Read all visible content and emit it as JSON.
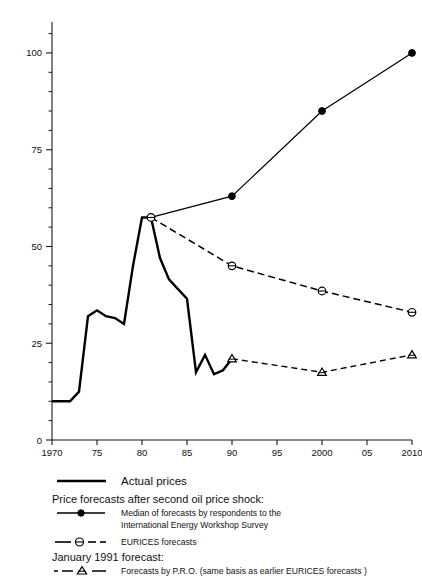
{
  "figure": {
    "y_axis_title": "CRUDE OIL PRICE* PER Bbl. 1990 $",
    "x_axis_title": "YEAR",
    "footnote": "*Average annual price for internationally traded crude oil"
  },
  "legend": {
    "actual_label": "Actual prices",
    "forecast_header": "Price forecasts after second oil price shock:",
    "iew_label_line1": "Median of forecasts by respondents to the",
    "iew_label_line2": "International Energy Workshop Survey",
    "eurices_label": "EURICES forecasts",
    "january_header": "January 1991 forecast:",
    "pro_label": "Forecasts by P.R.O. (same basis as earlier EURICES forecasts )"
  },
  "chart_data": {
    "type": "line",
    "title": "",
    "xlabel": "YEAR",
    "ylabel": "CRUDE OIL PRICE* PER Bbl. 1990 $",
    "xlim": [
      1970,
      2010
    ],
    "ylim": [
      0,
      108
    ],
    "grid": false,
    "legend_position": "below-plot",
    "xticks": [
      1970,
      1975,
      1980,
      1985,
      1990,
      1995,
      2000,
      2005,
      2010
    ],
    "xticklabels": [
      "1970",
      "75",
      "80",
      "85",
      "90",
      "95",
      "2000",
      "05",
      "2010"
    ],
    "yticks": [
      0,
      25,
      50,
      75,
      100
    ],
    "yticklabels": [
      "0",
      "25",
      "50",
      "75",
      "100"
    ],
    "yminorticks": [
      5,
      10,
      15,
      20,
      30,
      35,
      40,
      45,
      55,
      60,
      65,
      70,
      80,
      85,
      90,
      95,
      105
    ],
    "series": [
      {
        "name": "Actual prices",
        "style": "solid-thick",
        "marker": "none",
        "x": [
          1970,
          1971,
          1972,
          1973,
          1974,
          1975,
          1976,
          1977,
          1978,
          1979,
          1980,
          1981,
          1982,
          1983,
          1984,
          1985,
          1986,
          1987,
          1988,
          1989,
          1990
        ],
        "y": [
          10,
          10,
          10,
          12.5,
          32,
          33.5,
          32,
          31.5,
          30,
          45,
          57.5,
          57.5,
          47,
          41.5,
          39,
          36.5,
          17.5,
          22,
          17,
          18,
          21
        ]
      },
      {
        "name": "Median of forecasts by respondents to the International Energy Workshop Survey",
        "style": "solid-thin",
        "marker": "filled-circle",
        "x": [
          1981,
          1990,
          2000,
          2010
        ],
        "y": [
          57.5,
          63,
          85,
          100
        ]
      },
      {
        "name": "EURICES forecasts",
        "style": "dashed",
        "marker": "open-circle",
        "x": [
          1981,
          1990,
          2000,
          2010
        ],
        "y": [
          57.5,
          45,
          38.5,
          33
        ]
      },
      {
        "name": "Forecasts by P.R.O. (same basis as earlier EURICES forecasts )",
        "style": "dash-dot",
        "marker": "open-triangle",
        "x": [
          1990,
          2000,
          2010
        ],
        "y": [
          21,
          17.5,
          22
        ]
      }
    ]
  }
}
